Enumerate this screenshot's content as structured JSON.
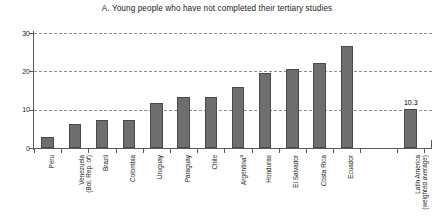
{
  "chart_data": {
    "type": "bar",
    "title": "A. Young people who have not completed their tertiary studies",
    "xlabel": "",
    "ylabel": "",
    "ylim": [
      0,
      30
    ],
    "yticks": [
      0,
      10,
      20,
      30
    ],
    "grid": true,
    "legend": false,
    "orientation": "vertical",
    "bar_color": "#6e6e6e",
    "categories": [
      "Peru",
      "Venezuela (Bol. Rep. of)",
      "Brazil",
      "Colombia",
      "Uruguay",
      "Paraguay",
      "Chile",
      "Argentina a",
      "Honduras",
      "El Salvador",
      "Costa Rica",
      "Ecuador",
      "Latin America (weighted average)"
    ],
    "values": [
      2.9,
      6.2,
      7.3,
      7.3,
      11.8,
      13.3,
      13.3,
      16.0,
      19.5,
      20.7,
      22.1,
      26.5,
      10.3
    ],
    "data_labels": [
      "",
      "",
      "",
      "",
      "",
      "",
      "",
      "",
      "",
      "",
      "",
      "",
      "10.3"
    ]
  },
  "axis": {
    "y_tick_labels": [
      "0",
      "10",
      "20",
      "30"
    ]
  },
  "categories_display": [
    {
      "line1": "Peru",
      "line2": "",
      "footnote": ""
    },
    {
      "line1": "Venezuela",
      "line2": "(Bol. Rep. of)",
      "footnote": ""
    },
    {
      "line1": "Brazil",
      "line2": "",
      "footnote": ""
    },
    {
      "line1": "Colombia",
      "line2": "",
      "footnote": ""
    },
    {
      "line1": "Uruguay",
      "line2": "",
      "footnote": ""
    },
    {
      "line1": "Paraguay",
      "line2": "",
      "footnote": ""
    },
    {
      "line1": "Chile",
      "line2": "",
      "footnote": ""
    },
    {
      "line1": "Argentina",
      "line2": "",
      "footnote": "a"
    },
    {
      "line1": "Honduras",
      "line2": "",
      "footnote": ""
    },
    {
      "line1": "El Salvador",
      "line2": "",
      "footnote": ""
    },
    {
      "line1": "Costa Rica",
      "line2": "",
      "footnote": ""
    },
    {
      "line1": "Ecuador",
      "line2": "",
      "footnote": ""
    },
    {
      "line1": "Latin America",
      "line2": "(weighted average)",
      "footnote": ""
    }
  ]
}
